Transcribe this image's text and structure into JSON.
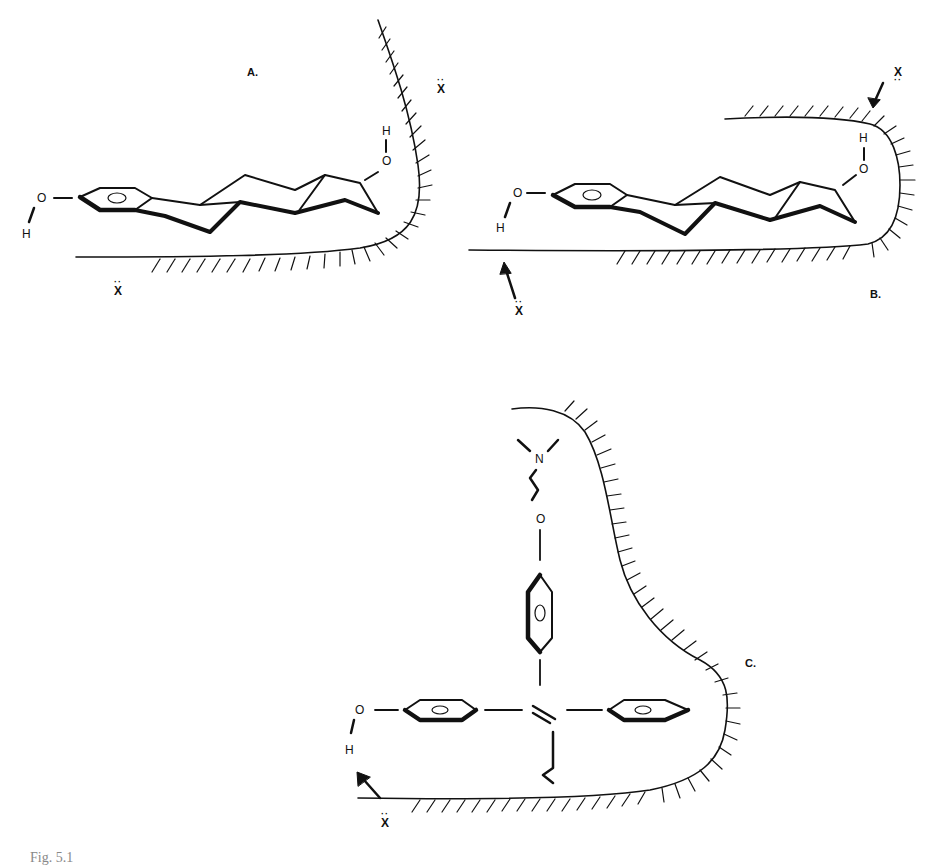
{
  "figure": {
    "panels": [
      {
        "id": "A",
        "label": "A.",
        "atoms": {
          "o_left": "O",
          "h_left": "H",
          "o_right": "O",
          "h_right": "H"
        },
        "x_labels": [
          "X",
          "X"
        ],
        "description": "Estradiol-like steroid in receptor pocket; phenolic OH and 17-OH facing nucleophilic X sites"
      },
      {
        "id": "B",
        "label": "B.",
        "atoms": {
          "o_left": "O",
          "h_left": "H",
          "o_right": "O",
          "h_right": "H"
        },
        "x_labels": [
          "X",
          "X"
        ],
        "description": "Steroid in enclosed pocket with arrows from X to OH groups"
      },
      {
        "id": "C",
        "label": "C.",
        "atoms": {
          "n": "N",
          "o_top": "O",
          "o_left": "O",
          "h_left": "H"
        },
        "x_labels": [
          "X"
        ],
        "description": "Triphenylethylene antiestrogen with aminoethoxy side chain in receptor pocket"
      }
    ],
    "caption": "Fig. 5.1"
  }
}
